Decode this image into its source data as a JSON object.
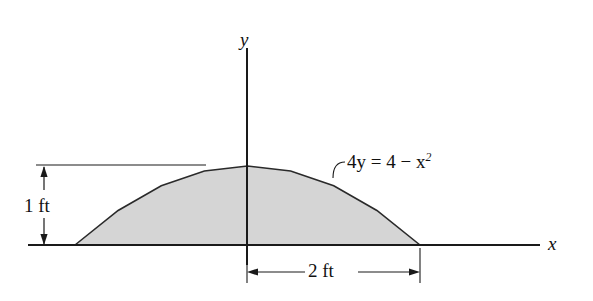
{
  "figure": {
    "background_color": "#ffffff",
    "line_color": "#1a1a1a",
    "fill_color": "#d5d5d5"
  },
  "axes": {
    "x_label": "x",
    "y_label": "y",
    "origin_px": {
      "x": 247,
      "y": 245
    },
    "x_axis_start_px": 28,
    "x_axis_end_px": 540,
    "y_axis_top_px": 48,
    "y_axis_bottom_px": 265
  },
  "curve": {
    "equation_label": "4y = 4 − x",
    "equation_exponent": "2",
    "equation_lhs": "4y",
    "equation_rhs": "4 − x²",
    "apex_px": {
      "x": 247,
      "y": 166
    },
    "left_root_px": 75,
    "right_root_px": 420
  },
  "dimensions": [
    {
      "name": "height",
      "label": "1 ft",
      "value": 1,
      "unit": "ft",
      "orientation": "vertical"
    },
    {
      "name": "half-width",
      "label": "2 ft",
      "value": 2,
      "unit": "ft",
      "orientation": "horizontal"
    }
  ],
  "chart_data": {
    "type": "area",
    "title": "",
    "xlabel": "x",
    "ylabel": "y",
    "annotations": [
      "4y = 4 − x²",
      "1 ft",
      "2 ft"
    ],
    "function": "y = (4 - x^2)/4",
    "x": [
      -2,
      -1.5,
      -1,
      -0.5,
      0,
      0.5,
      1,
      1.5,
      2
    ],
    "values": [
      0,
      0.4375,
      0.75,
      0.9375,
      1,
      0.9375,
      0.75,
      0.4375,
      0
    ],
    "xlim": [
      -2,
      2
    ],
    "ylim": [
      0,
      1
    ],
    "grid": false,
    "legend": "none"
  }
}
